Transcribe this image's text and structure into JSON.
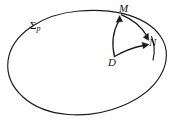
{
  "figure": {
    "background_color": "#ffffff",
    "stroke_color": "#1a1a1a",
    "width": 174,
    "height": 128,
    "labels": {
      "surface": "Σ",
      "surface_subscript": "p",
      "point_m": "M",
      "point_n": "N",
      "point_d": "D"
    },
    "elements": {
      "boundary_name": "closed-oval-boundary",
      "vector_dm": "arrow from D to M",
      "vector_dn": "arrow from D to N",
      "arc_mn": "arc from M to N"
    }
  }
}
